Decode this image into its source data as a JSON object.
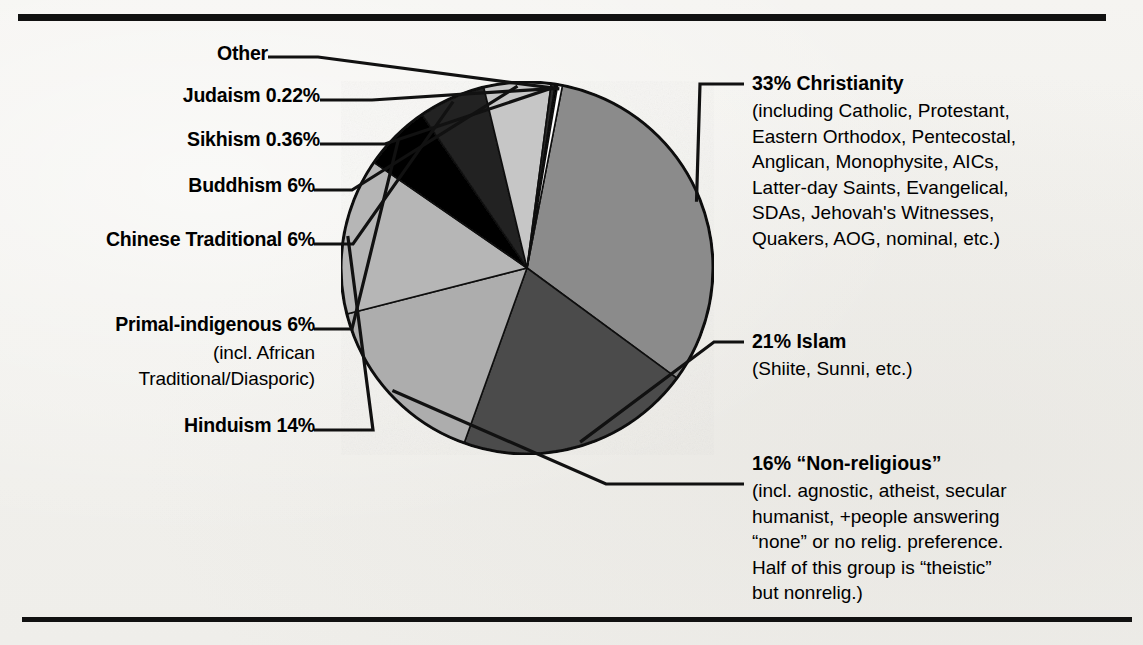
{
  "figure": {
    "background_color": "#f3f2ef",
    "ink_color": "#111111"
  },
  "chart_data": {
    "type": "pie",
    "title": "",
    "legend_position": "callout-labels",
    "grid": false,
    "categories": [
      "Christianity",
      "Islam",
      "Non-religious",
      "Hinduism",
      "Primal-indigenous",
      "Chinese Traditional",
      "Buddhism",
      "Sikhism",
      "Judaism",
      "Other"
    ],
    "values": [
      33,
      21,
      16,
      14,
      6,
      6,
      6,
      0.36,
      0.22,
      0.42
    ],
    "value_labels": [
      "33%",
      "21%",
      "16%",
      "14%",
      "6%",
      "6%",
      "6%",
      "0.36%",
      "0.22%",
      ""
    ],
    "slice_colors": [
      "#8b8b8b",
      "#4c4c4c",
      "#adadad",
      "#b6b6b6",
      "#000000",
      "#202020",
      "#c6c6c6",
      "#2b2b2b",
      "#000000",
      "#ffffff"
    ],
    "start_angle_deg": -79,
    "direction": "clockwise"
  },
  "labels_left": [
    {
      "id": "other",
      "text": "Other"
    },
    {
      "id": "judaism",
      "text": "Judaism 0.22%"
    },
    {
      "id": "sikhism",
      "text": "Sikhism 0.36%"
    },
    {
      "id": "buddhism",
      "text": "Buddhism 6%"
    },
    {
      "id": "chinese",
      "text": "Chinese Traditional 6%"
    },
    {
      "id": "primal",
      "text": "Primal-indigenous 6%"
    },
    {
      "id": "hinduism",
      "text": "Hinduism 14%"
    }
  ],
  "primal_sublines": [
    "(incl. African",
    "Traditional/Diasporic)"
  ],
  "labels_right": [
    {
      "id": "christianity",
      "head": "33% Christianity",
      "lines": [
        "(including Catholic, Protestant,",
        "Eastern Orthodox, Pentecostal,",
        "Anglican, Monophysite, AICs,",
        "Latter-day Saints, Evangelical,",
        "SDAs, Jehovah's Witnesses,",
        "Quakers, AOG, nominal, etc.)"
      ]
    },
    {
      "id": "islam",
      "head": "21% Islam",
      "lines": [
        "(Shiite, Sunni, etc.)"
      ]
    },
    {
      "id": "nonreligious",
      "head": "16% “Non-religious”",
      "lines": [
        "(incl. agnostic, atheist, secular",
        "humanist, +people answering",
        "“none” or no relig. preference.",
        "Half of this group is “theistic”",
        "but nonrelig.)"
      ]
    }
  ]
}
